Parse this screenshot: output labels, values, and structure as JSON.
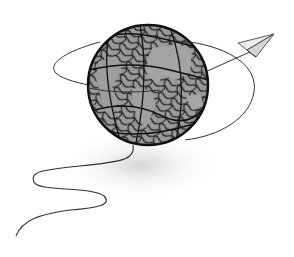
{
  "illustration": {
    "subject": "Scribbled globe with paper plane and flight trail",
    "elements": [
      {
        "name": "globe",
        "description": "Globe drawn with dense black scribbles over gray continents"
      },
      {
        "name": "orbit-ellipse",
        "description": "Thin line looping around the globe"
      },
      {
        "name": "paper-plane",
        "description": "Paper airplane at upper right trailing the line"
      },
      {
        "name": "flight-trail",
        "description": "Wavy line descending from globe to lower left"
      }
    ],
    "colors": {
      "background": "#ffffff",
      "ink": "#1a1a1a",
      "land": "#9a9a9a",
      "shadow": "#d8d8d8",
      "plane": "#e6e6e6"
    }
  }
}
